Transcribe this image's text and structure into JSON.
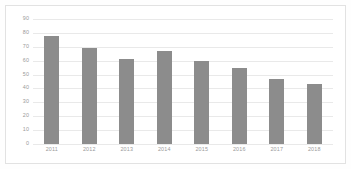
{
  "chart_data": {
    "type": "bar",
    "title": "",
    "subtitle": "",
    "xlabel": "",
    "ylabel": "",
    "categories": [
      "2011",
      "2012",
      "2013",
      "2014",
      "2015",
      "2016",
      "2017",
      "2018"
    ],
    "values": [
      78,
      69,
      61,
      67,
      60,
      55,
      47,
      43
    ],
    "series": [
      {
        "name": "",
        "values": [
          78,
          69,
          61,
          67,
          60,
          55,
          47,
          43
        ],
        "color": "#8c8c8c"
      }
    ],
    "ylim": [
      0,
      90
    ],
    "y_ticks": [
      0,
      10,
      20,
      30,
      40,
      50,
      60,
      70,
      80,
      90
    ],
    "y_tick_labels": [
      "0",
      "10",
      "20",
      "30",
      "40",
      "50",
      "60",
      "70",
      "80",
      "90"
    ],
    "x_tick_labels": [
      "2011",
      "2012",
      "2013",
      "2014",
      "2015",
      "2016",
      "2017",
      "2018"
    ],
    "grid": true,
    "grid_axis": "y",
    "legend": false,
    "legend_position": "none",
    "annotations": [],
    "data_labels": false
  },
  "colors": {
    "bar": "#8c8c8c",
    "gridline": "#e9e9e9",
    "tick_text": "#9a9a9a",
    "frame": "#e2e2e2",
    "background": "#ffffff"
  }
}
